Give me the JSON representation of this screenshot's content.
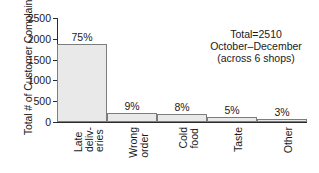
{
  "chart_data": {
    "type": "bar",
    "title": "",
    "subtitle": "",
    "xlabel": "",
    "ylabel": "Total # of Customer Complaints",
    "ylim": [
      0,
      2500
    ],
    "yticks": [
      0,
      500,
      1000,
      1500,
      2000,
      2500
    ],
    "ytick_labels": [
      "0",
      "500",
      "1000",
      "1500",
      "2000",
      "2500"
    ],
    "grid": false,
    "legend": false,
    "categories": [
      "Late deliv-\neries",
      "Wrong\norder",
      "Cold\nfood",
      "Taste",
      "Other"
    ],
    "category_lines": [
      [
        "Late",
        "deliv-",
        "eries"
      ],
      [
        "Wrong",
        "order"
      ],
      [
        "Cold",
        "food"
      ],
      [
        "Taste"
      ],
      [
        "Other"
      ]
    ],
    "values": [
      1880,
      226,
      201,
      126,
      75
    ],
    "data_labels": [
      "75%",
      "9%",
      "8%",
      "5%",
      "3%"
    ],
    "percentages": [
      75,
      9,
      8,
      5,
      3
    ],
    "annotations": [
      "Total=2510",
      "October–December",
      "(across 6 shops)"
    ],
    "colors": {
      "bar_fill": "#e9e9e9",
      "bar_border": "#7d7d7d",
      "axis": "#2b2b2b",
      "text": "#1a1a1a",
      "background": "#ffffff"
    }
  },
  "annotation": {
    "line1": "Total=2510",
    "line2": "October–December",
    "line3": "(across 6 shops)"
  },
  "yaxis": {
    "title": "Total # of Customer Complaints"
  }
}
